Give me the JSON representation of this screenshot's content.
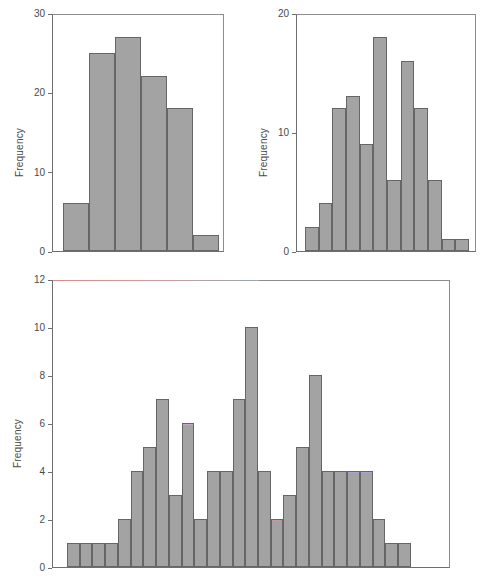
{
  "figure": {
    "title": "",
    "panel_count": 3,
    "bar_fill_color": "#a3a3a3",
    "bar_edge_color": "#666666",
    "axis_color": "#6e6e6e",
    "background_color": "#ffffff"
  },
  "panels": [
    {
      "id": "top-left",
      "ylabel": "Frequency",
      "yticks": [
        "0",
        "10",
        "20",
        "30"
      ]
    },
    {
      "id": "top-right",
      "ylabel": "Frequency",
      "yticks": [
        "0",
        "10",
        "20"
      ]
    },
    {
      "id": "bottom",
      "ylabel": "Frequency",
      "yticks": [
        "0",
        "2",
        "4",
        "6",
        "8",
        "10",
        "12"
      ]
    }
  ],
  "chart_data": [
    {
      "type": "bar",
      "id": "top-left-histogram",
      "title": "",
      "xlabel": "",
      "ylabel": "Frequency",
      "ylim": [
        0,
        30
      ],
      "ytick_values": [
        0,
        10,
        20,
        30
      ],
      "grid": false,
      "legend": null,
      "categories": [
        "1",
        "2",
        "3",
        "4",
        "5",
        "6"
      ],
      "values": [
        6,
        25,
        27,
        22,
        18,
        2
      ]
    },
    {
      "type": "bar",
      "id": "top-right-histogram",
      "title": "",
      "xlabel": "",
      "ylabel": "Frequency",
      "ylim": [
        0,
        20
      ],
      "ytick_values": [
        0,
        10,
        20
      ],
      "grid": false,
      "legend": null,
      "categories": [
        "1",
        "2",
        "3",
        "4",
        "5",
        "6",
        "7",
        "8",
        "9",
        "10",
        "11",
        "12"
      ],
      "values": [
        2,
        4,
        12,
        13,
        9,
        18,
        6,
        16,
        12,
        6,
        1,
        1
      ]
    },
    {
      "type": "bar",
      "id": "bottom-histogram",
      "title": "",
      "xlabel": "",
      "ylabel": "Frequency",
      "ylim": [
        0,
        12
      ],
      "ytick_values": [
        0,
        2,
        4,
        6,
        8,
        10,
        12
      ],
      "grid": false,
      "legend": null,
      "categories": [
        "1",
        "2",
        "3",
        "4",
        "5",
        "6",
        "7",
        "8",
        "9",
        "10",
        "11",
        "12",
        "13",
        "14",
        "15",
        "16",
        "17",
        "18",
        "19",
        "20",
        "21",
        "22",
        "23",
        "24",
        "25",
        "26",
        "27"
      ],
      "values": [
        1,
        1,
        1,
        1,
        2,
        4,
        5,
        7,
        3,
        6,
        2,
        4,
        4,
        7,
        10,
        4,
        2,
        3,
        5,
        8,
        4,
        4,
        4,
        4,
        2,
        1,
        1
      ]
    }
  ]
}
